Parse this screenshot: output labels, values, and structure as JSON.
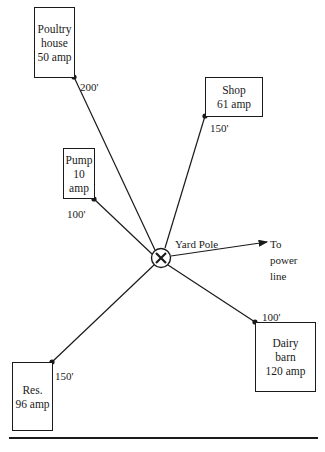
{
  "diagram": {
    "type": "electrical service distribution layout",
    "center": {
      "name": "Yard Pole",
      "label": "Yard Pole",
      "symbol": "circle-x"
    },
    "feed": {
      "line1": "To",
      "line2": "power",
      "line3": "line"
    },
    "buildings": [
      {
        "id": "poultry",
        "lines": [
          "Poultry",
          "house",
          "50 amp"
        ],
        "distance": "200'"
      },
      {
        "id": "shop",
        "lines": [
          "Shop",
          "61 amp"
        ],
        "distance": "150'"
      },
      {
        "id": "pump",
        "lines": [
          "Pump",
          "10",
          "amp"
        ],
        "distance": "100'"
      },
      {
        "id": "dairy",
        "lines": [
          "Dairy",
          "barn",
          "120 amp"
        ],
        "distance": "100'"
      },
      {
        "id": "res",
        "lines": [
          "Res.",
          "96 amp"
        ],
        "distance": "150'"
      }
    ],
    "colors": {
      "ink": "#1a1a1a",
      "background": "#ffffff"
    }
  }
}
